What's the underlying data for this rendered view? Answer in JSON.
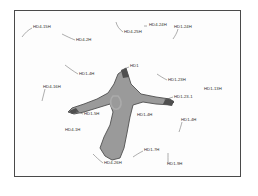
{
  "figure": {
    "frame": {
      "border_color": "#4a4a4a",
      "background_color": "#fdfdfd",
      "page_background_color": "#ffffff"
    },
    "specimen": {
      "name": "four-armed star specimen region",
      "fill_color": "#9a9a9a",
      "outline_color": "#4f4f4f",
      "highlight_color": "#b5b5b5",
      "interior_mark_color": "#ababab"
    },
    "leader_line_color": "#6b6b6b"
  },
  "annotations": [
    {
      "id": "a01",
      "label": "HD4-15H",
      "x": 33,
      "y": 27
    },
    {
      "id": "a02",
      "label": "HD4-2H",
      "x": 76,
      "y": 40
    },
    {
      "id": "a03",
      "label": "HD4-25H",
      "x": 124,
      "y": 32
    },
    {
      "id": "a04",
      "label": "HD4-24H",
      "x": 149,
      "y": 25
    },
    {
      "id": "a05",
      "label": "HD1-24H",
      "x": 174,
      "y": 27
    },
    {
      "id": "a06",
      "label": "HD1",
      "x": 130,
      "y": 66
    },
    {
      "id": "a07",
      "label": "HD1-4H",
      "x": 79,
      "y": 74
    },
    {
      "id": "a08",
      "label": "HD1-23H",
      "x": 168,
      "y": 80
    },
    {
      "id": "a09",
      "label": "HD4-16H",
      "x": 43,
      "y": 87
    },
    {
      "id": "a10",
      "label": "HD1-13H",
      "x": 204,
      "y": 89
    },
    {
      "id": "a11",
      "label": "HD1-23-1",
      "x": 174,
      "y": 97
    },
    {
      "id": "a12",
      "label": "HD1-5H",
      "x": 84,
      "y": 114
    },
    {
      "id": "a13",
      "label": "HD1-4H",
      "x": 137,
      "y": 115
    },
    {
      "id": "a14",
      "label": "HD1-4H",
      "x": 181,
      "y": 120
    },
    {
      "id": "a15",
      "label": "HD4-1H",
      "x": 65,
      "y": 130
    },
    {
      "id": "a16",
      "label": "HD1-7H",
      "x": 144,
      "y": 150
    },
    {
      "id": "a17",
      "label": "HD4-26H",
      "x": 104,
      "y": 163
    },
    {
      "id": "a18",
      "label": "HD1-9H",
      "x": 167,
      "y": 164
    }
  ],
  "leaders": [
    {
      "id": "l01",
      "for": "HD4-15H",
      "path": "M32,28 C28,30 25,33 22,37"
    },
    {
      "id": "l02",
      "for": "HD4-2H",
      "path": "M75,40 C70,38 66,36 62,34"
    },
    {
      "id": "l03",
      "for": "HD4-25H",
      "path": "M123,32 C119,29 117,26 116,22"
    },
    {
      "id": "l04",
      "for": "HD4-24H",
      "path": "M147,26 C146,26 145,26 144,26"
    },
    {
      "id": "l05",
      "for": "HD1-24H",
      "path": "M178,29 C177,33 175,36 173,39"
    },
    {
      "id": "l06",
      "for": "HD1",
      "path": "M129,67 C126,68 124,69 122,70"
    },
    {
      "id": "l07",
      "for": "HD1-4H",
      "path": "M78,74 C73,71 69,68 65,65"
    },
    {
      "id": "l08",
      "for": "HD1-23H",
      "path": "M167,80 C163,78 160,76 157,74"
    },
    {
      "id": "l09",
      "for": "HD4-16H",
      "path": "M45,89 C44,93 43,97 42,101"
    },
    {
      "id": "l10",
      "for": "HD1-23-1",
      "path": "M173,97 C170,98 167,99 164,100"
    },
    {
      "id": "l11",
      "for": "HD1-5H",
      "path": "M83,114 C80,113 78,112 76,111"
    },
    {
      "id": "l12",
      "for": "HD1-4H-r",
      "path": "M182,122 C181,126 180,129 179,132"
    },
    {
      "id": "l13",
      "for": "HD1-7H",
      "path": "M143,151 C139,153 136,155 133,157"
    },
    {
      "id": "l14",
      "for": "HD4-26H",
      "path": "M103,163 C99,160 96,157 93,154"
    },
    {
      "id": "l15",
      "for": "HD1-9H",
      "path": "M168,163 C168,159 168,156 168,153"
    }
  ],
  "specimen_shape": {
    "body_path": "M126,68 L131,84 L141,94 L156,97 L170,99 L174,102 L171,105 L156,104 L143,102 L133,105 L130,117 L127,133 L124,148 L120,158 L112,160 L105,156 L100,148 L104,137 L110,125 L113,112 L110,104 L97,108 L84,112 L74,114 L68,112 L72,108 L84,104 L97,99 L108,93 L114,84 L118,74 Z",
    "outline_path": "M126,68 L131,84 L141,94 L156,97 L170,99 L174,102 L171,105 L156,104 L143,102 L133,105 L130,117 L127,133 L124,148 L120,158 L112,160 L105,156 L100,148 L104,137 L110,125 L113,112 L110,104 L97,108 L84,112 L74,114 L68,112 L72,108 L84,104 L97,99 L108,93 L114,84 L118,74 Z",
    "interior_mark_path": "M113,96 C110,99 110,104 112,107 C114,110 118,110 120,107 C122,104 121,99 118,96 Z",
    "tip_right_path": "M166,98 L174,101 L172,106 L163,104 Z",
    "tip_left_path": "M69,111 L76,108 L79,112 L72,114 Z",
    "tip_top_path": "M121,70 L126,68 L129,77 L123,78 Z"
  }
}
